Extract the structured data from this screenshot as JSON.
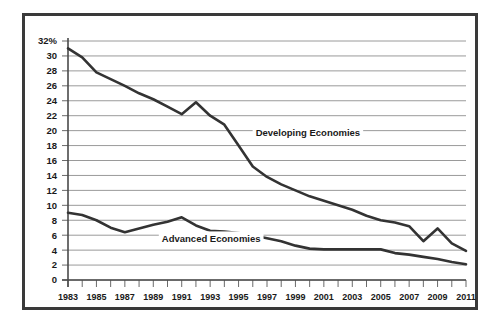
{
  "chart_data": {
    "type": "line",
    "title": "",
    "xlabel": "",
    "ylabel": "",
    "ylim": [
      0,
      32
    ],
    "xlim": [
      1983,
      2011
    ],
    "grid": true,
    "legend": "inline-labels",
    "y_ticks": [
      "32%",
      "30",
      "28",
      "26",
      "24",
      "22",
      "20",
      "18",
      "16",
      "14",
      "12",
      "10",
      "8",
      "6",
      "4",
      "2",
      "0"
    ],
    "y_tick_values": [
      32,
      30,
      28,
      26,
      24,
      22,
      20,
      18,
      16,
      14,
      12,
      10,
      8,
      6,
      4,
      2,
      0
    ],
    "x_ticks": [
      "1983",
      "1985",
      "1987",
      "1989",
      "1991",
      "1993",
      "1995",
      "1997",
      "1999",
      "2001",
      "2003",
      "2005",
      "2007",
      "2009",
      "2011"
    ],
    "x_tick_values": [
      1983,
      1985,
      1987,
      1989,
      1991,
      1993,
      1995,
      1997,
      1999,
      2001,
      2003,
      2005,
      2007,
      2009,
      2011
    ],
    "x_all_years": [
      1983,
      1984,
      1985,
      1986,
      1987,
      1988,
      1989,
      1990,
      1991,
      1992,
      1993,
      1994,
      1995,
      1996,
      1997,
      1998,
      1999,
      2000,
      2001,
      2002,
      2003,
      2004,
      2005,
      2006,
      2007,
      2008,
      2009,
      2010,
      2011
    ],
    "series": [
      {
        "name": "Developing Economies",
        "label_x": 1996.2,
        "label_y": 19.3,
        "color": "#333333",
        "values": [
          31.0,
          29.8,
          27.8,
          26.9,
          26.0,
          25.0,
          24.2,
          23.2,
          22.2,
          23.8,
          22.0,
          20.8,
          18.0,
          15.2,
          13.8,
          12.8,
          12.0,
          11.2,
          10.6,
          10.0,
          9.4,
          8.6,
          8.0,
          7.7,
          7.2,
          5.2,
          6.9,
          4.9,
          3.9
        ]
      },
      {
        "name": "Advanced Economies",
        "label_x": 1989.6,
        "label_y": 5.1,
        "color": "#333333",
        "values": [
          9.0,
          8.7,
          8.0,
          7.0,
          6.4,
          6.9,
          7.4,
          7.8,
          8.4,
          7.3,
          6.6,
          6.5,
          6.3,
          6.0,
          5.6,
          5.2,
          4.6,
          4.2,
          4.1,
          4.1,
          4.1,
          4.1,
          4.1,
          3.6,
          3.4,
          3.1,
          2.8,
          2.4,
          2.1
        ]
      }
    ]
  }
}
